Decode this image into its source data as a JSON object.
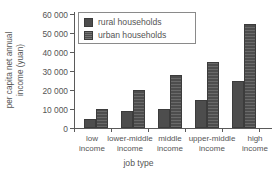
{
  "chart_data": {
    "type": "bar",
    "title": "",
    "xlabel": "job type",
    "ylabel_lines": [
      "per capita net annual",
      "income (yuan)"
    ],
    "ylabel": "per capita net annual income (yuan)",
    "categories": [
      "low income",
      "lower-middle income",
      "middle income",
      "upper-middle income",
      "high income"
    ],
    "category_lines": [
      [
        "low",
        "income"
      ],
      [
        "lower-middle",
        "income"
      ],
      [
        "middle",
        "income"
      ],
      [
        "upper-middle",
        "income"
      ],
      [
        "high",
        "income"
      ]
    ],
    "series": [
      {
        "name": "rural households",
        "values": [
          5000,
          9000,
          10000,
          15000,
          25000
        ],
        "color": "#4d4d4d",
        "pattern": "solid"
      },
      {
        "name": "urban households",
        "values": [
          10000,
          20000,
          28000,
          35000,
          55000
        ],
        "color": "#4d4d4d",
        "pattern": "hatched"
      }
    ],
    "ylim": [
      0,
      60000
    ],
    "ytick_values": [
      0,
      10000,
      20000,
      30000,
      40000,
      50000,
      60000
    ],
    "ytick_labels": [
      "0",
      "10 000",
      "20 000",
      "30 000",
      "40 000",
      "50 000",
      "60 000"
    ],
    "grid": false,
    "legend_position": "top-left-inside",
    "legend_entries": [
      "rural households",
      "urban households"
    ]
  }
}
